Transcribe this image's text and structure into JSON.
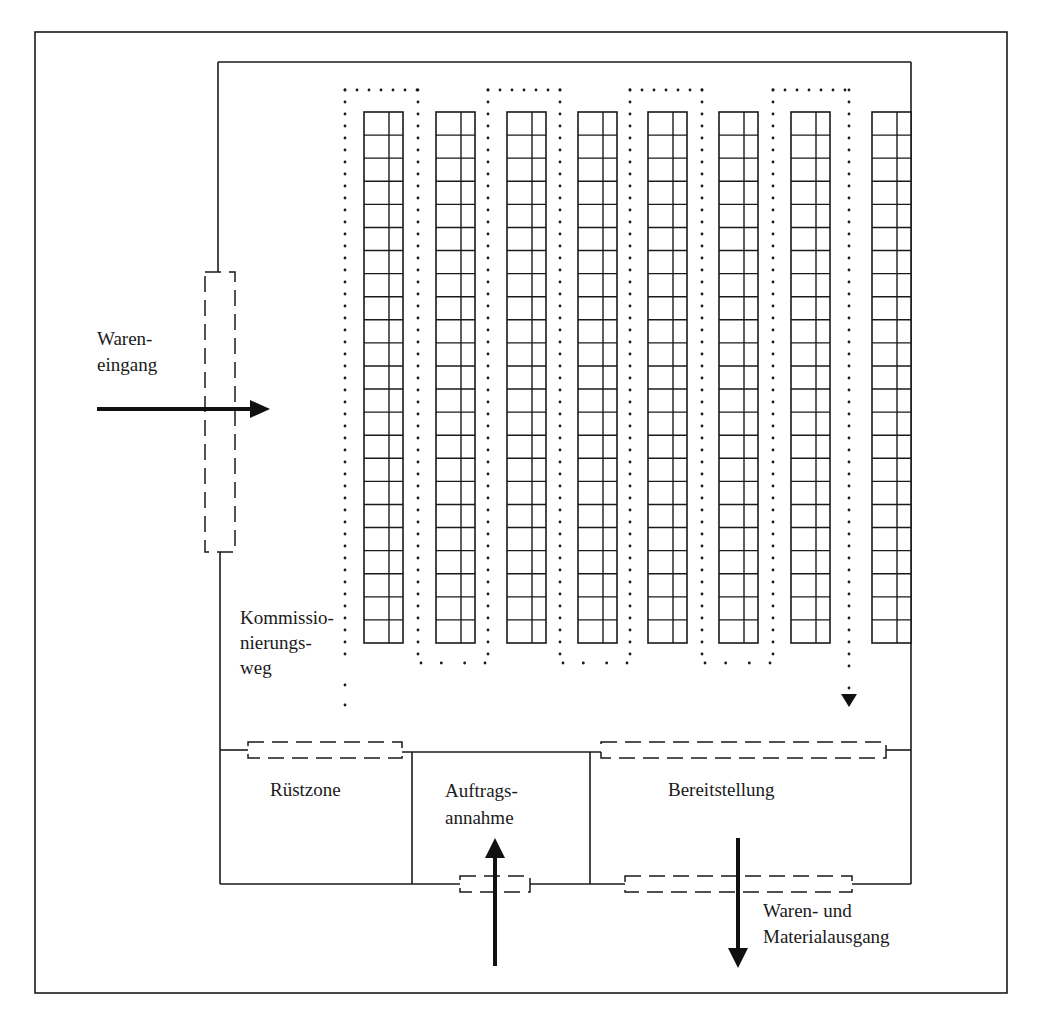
{
  "diagram": {
    "labels": {
      "wareneingang": [
        "Waren-",
        "eingang"
      ],
      "kommissionierungsweg": [
        "Kommissio-",
        "nierungs-",
        "weg"
      ],
      "ruestzone": "Rüstzone",
      "auftragsannahme": [
        "Auftrags-",
        "annahme"
      ],
      "bereitstellung": "Bereitstellung",
      "warenausgang": [
        "Waren- und",
        "Materialausgang"
      ]
    },
    "racks": {
      "count": 8,
      "rows_per_rack": 23,
      "columns_per_rack": 2,
      "x_positions": [
        364,
        436,
        507,
        578,
        648,
        719,
        791,
        872
      ],
      "width": 39,
      "top": 112,
      "bottom": 643
    },
    "picking_path": {
      "style": "dotted",
      "columns_x": [
        345,
        418,
        488,
        560,
        630,
        702,
        773,
        849
      ],
      "top_y": 90,
      "bottom_y": 663,
      "start_bottom_y": 705,
      "end_arrow_y": 706
    },
    "zones": [
      "Rüstzone",
      "Auftragsannahme",
      "Bereitstellung"
    ],
    "flows": [
      {
        "name": "Wareneingang",
        "direction": "right"
      },
      {
        "name": "Auftragsannahme",
        "direction": "up"
      },
      {
        "name": "Waren- und Materialausgang",
        "direction": "down"
      }
    ],
    "colors": {
      "line": "#1a1a1a",
      "background": "#ffffff"
    }
  }
}
